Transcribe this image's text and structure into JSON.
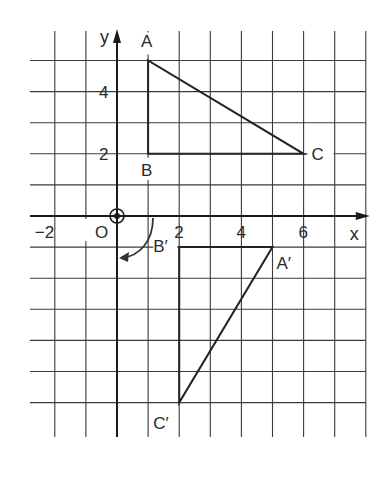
{
  "diagram": {
    "type": "coordinate-grid-rotation",
    "axes": {
      "x_label": "x",
      "y_label": "y",
      "origin_label": "O",
      "x_ticks": [
        {
          "value": -2,
          "label": "−2"
        },
        {
          "value": 2,
          "label": "2"
        },
        {
          "value": 4,
          "label": "4"
        },
        {
          "value": 6,
          "label": "6"
        }
      ],
      "y_ticks": [
        {
          "value": 2,
          "label": "2"
        },
        {
          "value": 4,
          "label": "4"
        }
      ],
      "grid_x_range": [
        -2,
        8
      ],
      "grid_y_range": [
        -6,
        5
      ]
    },
    "object": {
      "name": "triangle ABC",
      "vertices": [
        {
          "label": "A",
          "x": 1,
          "y": 5
        },
        {
          "label": "B",
          "x": 1,
          "y": 2
        },
        {
          "label": "C",
          "x": 6,
          "y": 2
        }
      ]
    },
    "image": {
      "name": "triangle A'B'C'",
      "vertices": [
        {
          "label": "A′",
          "x": 5,
          "y": -1
        },
        {
          "label": "B′",
          "x": 2,
          "y": -1
        },
        {
          "label": "C′",
          "x": 2,
          "y": -6
        }
      ]
    },
    "transformation": {
      "kind": "rotation",
      "centre": "O",
      "angle_degrees": 90,
      "direction": "clockwise"
    },
    "colors": {
      "ink": "#222222",
      "grid": "#3a3a3a",
      "background": "#ffffff"
    }
  }
}
